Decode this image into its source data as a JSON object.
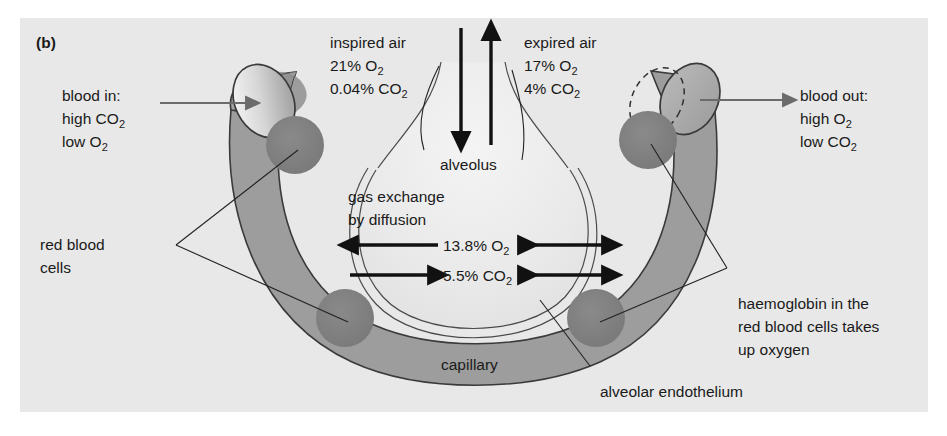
{
  "figure": {
    "panel_label": "(b)",
    "background_color": "#e8e8e8",
    "page_color": "#ffffff"
  },
  "colors": {
    "capillary_fill": "#9d9d9d",
    "capillary_fill_light": "#b4b4b4",
    "red_blood_cell": "#7e7e7e",
    "alveolus_fill": "#ededed",
    "endothelium": "#e4e4e4",
    "text": "#1a1a1a",
    "arrow_black": "#111111",
    "arrow_gray": "#6b6b6b"
  },
  "labels": {
    "blood_in": {
      "line1": "blood in:",
      "line2_pre": "high CO",
      "line2_sub": "2",
      "line3_pre": "low O",
      "line3_sub": "2"
    },
    "blood_out": {
      "line1": "blood out:",
      "line2_pre": "high O",
      "line2_sub": "2",
      "line3_pre": "low CO",
      "line3_sub": "2"
    },
    "inspired_air": {
      "line1": "inspired air",
      "line2_pre": "21% O",
      "line2_sub": "2",
      "line3_pre": "0.04% CO",
      "line3_sub": "2"
    },
    "expired_air": {
      "line1": "expired air",
      "line2_pre": "17% O",
      "line2_sub": "2",
      "line3_pre": "4% CO",
      "line3_sub": "2"
    },
    "alveolus": "alveolus",
    "gas_exchange": {
      "line1": "gas exchange",
      "line2": "by diffusion"
    },
    "exchange_o2": {
      "value": "13.8% O",
      "sub": "2"
    },
    "exchange_co2": {
      "value": "5.5% CO",
      "sub": "2"
    },
    "red_blood_cells": {
      "line1": "red blood",
      "line2": "cells"
    },
    "capillary": "capillary",
    "haemoglobin": {
      "line1": "haemoglobin in the",
      "line2": "red blood cells takes",
      "line3": "up oxygen"
    },
    "alveolar_endothelium": "alveolar endothelium"
  },
  "diagram_data": {
    "type": "diagram",
    "subject": "Gas exchange between an alveolus and a capillary",
    "gas_values": [
      {
        "gas": "O2",
        "inspired_air": "21%",
        "expired_air": "17%",
        "exchange_surface": "13.8%"
      },
      {
        "gas": "CO2",
        "inspired_air": "0.04%",
        "expired_air": "4%",
        "exchange_surface": "5.5%"
      }
    ],
    "flow_directions": {
      "inspired_air": "down-into-alveolus",
      "expired_air": "up-out-of-alveolus",
      "o2_left_arrow": "leftwards-into-blood",
      "o2_right_arrow": "bidirectional",
      "co2_left_arrow": "rightwards-into-alveolus",
      "co2_right_arrow": "bidirectional",
      "blood_in": "rightwards",
      "blood_out": "rightwards"
    }
  }
}
